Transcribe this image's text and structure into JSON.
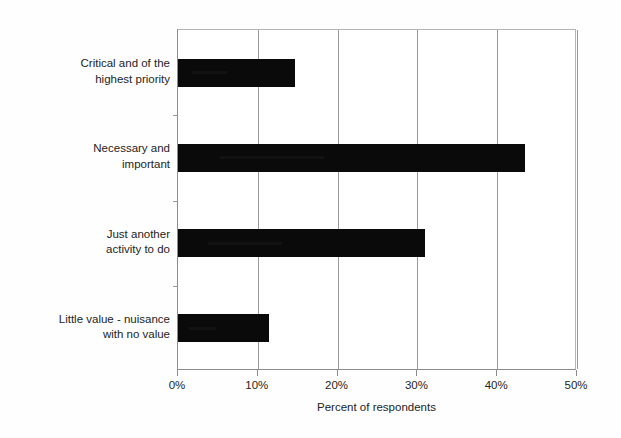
{
  "chart_data": {
    "type": "bar",
    "orientation": "horizontal",
    "title": "",
    "subtitle": "",
    "xlabel": "Percent of respondents",
    "ylabel": "",
    "categories": [
      "Critical and of the\nhighest priority",
      "Necessary and\nimportant",
      "Just another\nactivity to do",
      "Little value - nuisance\nwith no value"
    ],
    "values": [
      14.7,
      43.5,
      30.9,
      11.4
    ],
    "value_unit": "%",
    "xlim": [
      0,
      50
    ],
    "xticks": [
      0,
      10,
      20,
      30,
      40,
      50
    ],
    "xtick_labels": [
      "0%",
      "10%",
      "20%",
      "30%",
      "40%",
      "50%"
    ],
    "grid": "vertical-only",
    "legend": "none",
    "bar_color": "#0a0a0a",
    "gridline_color": "#9a9a9a",
    "axis_color": "#8c8c8c",
    "background": "#ffffff"
  },
  "axis": {
    "x_title": "Percent of respondents"
  }
}
